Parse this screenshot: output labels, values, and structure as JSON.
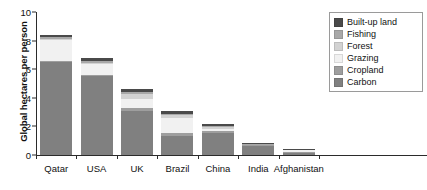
{
  "chart_data": {
    "type": "bar",
    "subtype": "stacked-vertical",
    "title": "",
    "xlabel": "",
    "ylabel": "Global hectares per person",
    "ylim": [
      0,
      10
    ],
    "yticks": [
      0,
      2,
      4,
      6,
      8,
      10
    ],
    "ytick_labels": [
      "0",
      "2",
      "4",
      "6",
      "8",
      "10"
    ],
    "grid": false,
    "legend_position": "top-right",
    "categories": [
      "Qatar",
      "USA",
      "UK",
      "Brazil",
      "China",
      "India",
      "Afghanistan"
    ],
    "series": [
      {
        "name": "Carbon",
        "color": "#808080",
        "values": [
          6.5,
          5.5,
          3.1,
          1.35,
          1.55,
          0.6,
          0.12
        ]
      },
      {
        "name": "Cropland",
        "color": "#9e9e9e",
        "values": [
          0.1,
          0.12,
          0.18,
          0.18,
          0.14,
          0.07,
          0.06
        ]
      },
      {
        "name": "Grazing",
        "color": "#f1f1f1",
        "values": [
          1.45,
          0.72,
          0.62,
          1.05,
          0.16,
          0.03,
          0.14
        ]
      },
      {
        "name": "Forest",
        "color": "#d2d2d2",
        "values": [
          0.09,
          0.11,
          0.36,
          0.2,
          0.12,
          0.03,
          0.04
        ]
      },
      {
        "name": "Fishing",
        "color": "#a8a8a8",
        "values": [
          0.09,
          0.1,
          0.12,
          0.08,
          0.06,
          0.02,
          0.02
        ]
      },
      {
        "name": "Built-up land",
        "color": "#4a4a4a",
        "values": [
          0.17,
          0.21,
          0.22,
          0.21,
          0.17,
          0.08,
          0.03
        ]
      }
    ],
    "totals": [
      8.4,
      6.76,
      4.6,
      3.07,
      2.2,
      0.83,
      0.41
    ],
    "legend_entries": [
      {
        "label": "Built-up land",
        "color": "#4a4a4a"
      },
      {
        "label": "Fishing",
        "color": "#a8a8a8"
      },
      {
        "label": "Forest",
        "color": "#d2d2d2"
      },
      {
        "label": "Grazing",
        "color": "#f1f1f1"
      },
      {
        "label": "Cropland",
        "color": "#9e9e9e"
      },
      {
        "label": "Carbon",
        "color": "#808080"
      }
    ]
  }
}
